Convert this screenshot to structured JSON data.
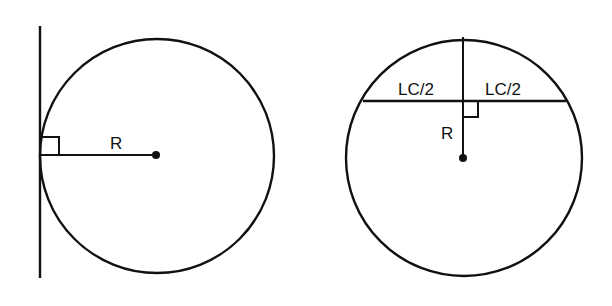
{
  "figures": [
    {
      "id": "tangent-figure",
      "description": "Tangent line perpendicular to radius at point of tangency",
      "labels": {
        "radius": "R"
      }
    },
    {
      "id": "chord-figure",
      "description": "Radius perpendicular bisector of long chord",
      "labels": {
        "radius": "R",
        "half_chord_left": "LC/2",
        "half_chord_right": "LC/2"
      }
    }
  ],
  "colors": {
    "ink": "#111111",
    "background": "#ffffff"
  }
}
